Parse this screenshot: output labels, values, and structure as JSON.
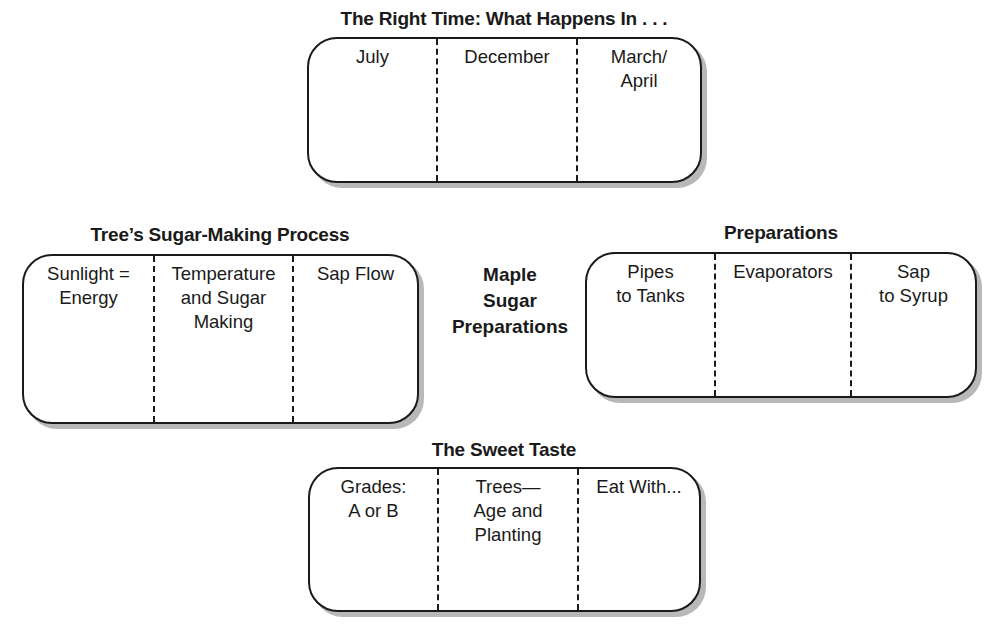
{
  "center": {
    "label": "Maple\nSugar\nPreparations"
  },
  "sections": {
    "top": {
      "title": "The Right Time: What Happens In . . .",
      "columns": [
        "July",
        "December",
        "March/\nApril"
      ]
    },
    "left": {
      "title": "Tree’s Sugar-Making Process",
      "columns": [
        "Sunlight =\nEnergy",
        "Temperature\nand Sugar\nMaking",
        "Sap Flow"
      ]
    },
    "right": {
      "title": "Preparations",
      "columns": [
        "Pipes\nto Tanks",
        "Evaporators",
        "Sap\nto Syrup"
      ]
    },
    "bottom": {
      "title": "The Sweet Taste",
      "columns": [
        "Grades:\nA or B",
        "Trees—\nAge and\nPlanting",
        "Eat With..."
      ]
    }
  }
}
